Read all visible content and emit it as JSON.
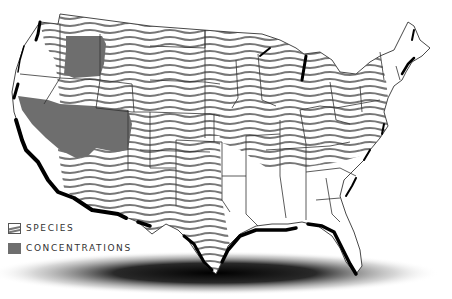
{
  "map": {
    "subject": "United States species range map",
    "colors": {
      "background": "#ffffff",
      "state_border": "#333333",
      "coastline": "#000000",
      "species_hatch": "#777777",
      "concentration_fill": "#6e6e6e",
      "shadow": "#000000"
    }
  },
  "legend": {
    "items": [
      {
        "icon": "wavy-hatch-swatch",
        "label": "SPECIES"
      },
      {
        "icon": "solid-gray-swatch",
        "label": "CONCENTRATIONS"
      }
    ]
  }
}
